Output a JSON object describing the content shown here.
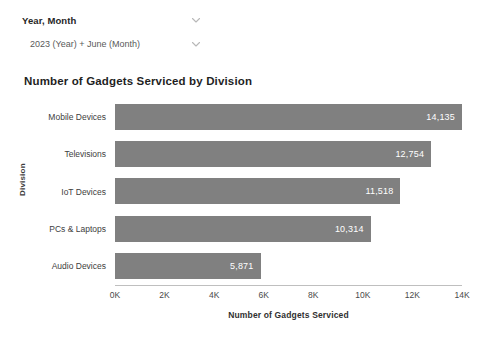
{
  "filters": {
    "primary": {
      "label": "Year, Month",
      "icon": "chevron-down-icon"
    },
    "secondary": {
      "value": "2023 (Year) + June (Month)",
      "icon": "chevron-down-icon"
    }
  },
  "chart_data": {
    "type": "bar",
    "orientation": "horizontal",
    "title": "Number of Gadgets Serviced by Division",
    "xlabel": "Number of Gadgets Serviced",
    "ylabel": "Division",
    "categories": [
      "Mobile Devices",
      "Televisions",
      "IoT Devices",
      "PCs & Laptops",
      "Audio Devices"
    ],
    "values": [
      14135,
      12754,
      11518,
      10314,
      5871
    ],
    "value_labels": [
      "14,135",
      "12,754",
      "11,518",
      "10,314",
      "5,871"
    ],
    "xlim": [
      0,
      14000
    ],
    "xticks": [
      0,
      2000,
      4000,
      6000,
      8000,
      10000,
      12000,
      14000
    ],
    "xtick_labels": [
      "0K",
      "2K",
      "4K",
      "6K",
      "8K",
      "10K",
      "12K",
      "14K"
    ],
    "grid": false,
    "legend": false,
    "bar_color": "#808080",
    "value_label_color": "#ffffff"
  }
}
